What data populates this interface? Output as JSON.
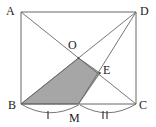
{
  "figure": {
    "kind": "geometry-diagram",
    "shape": "rectangle-with-diagonals",
    "width": 156,
    "height": 127,
    "background_color": "#ffffff",
    "stroke_color": "#555555",
    "label_color": "#1a1a1a",
    "shaded_fill_color": "#a6a6a6",
    "shaded_fill_opacity": 1
  },
  "labels": {
    "A": "A",
    "B": "B",
    "C": "C",
    "D": "D",
    "O": "O",
    "E": "E",
    "M": "M"
  },
  "points": {
    "A": {
      "x": 21,
      "y": 12
    },
    "D": {
      "x": 136,
      "y": 12
    },
    "B": {
      "x": 21,
      "y": 104
    },
    "C": {
      "x": 136,
      "y": 104
    },
    "O": {
      "x": 78.5,
      "y": 58
    },
    "E": {
      "x": 100,
      "y": 73
    },
    "M": {
      "x": 78.5,
      "y": 104
    }
  },
  "segments": [
    {
      "name": "side-AD",
      "from": "A",
      "to": "D"
    },
    {
      "name": "side-AB",
      "from": "A",
      "to": "B"
    },
    {
      "name": "side-DC",
      "from": "D",
      "to": "C"
    },
    {
      "name": "side-BC",
      "from": "B",
      "to": "C"
    },
    {
      "name": "diagonal-AC",
      "from": "A",
      "to": "C"
    },
    {
      "name": "diagonal-BD",
      "from": "B",
      "to": "D"
    },
    {
      "name": "cevian-DM",
      "from": "D",
      "to": "M"
    }
  ],
  "shaded_region": {
    "name": "quadrilateral-BOEM",
    "vertices": [
      "B",
      "O",
      "E",
      "M"
    ]
  },
  "arcs": [
    {
      "name": "arc-BM",
      "from": "B",
      "to": "M",
      "tick_count": 1
    },
    {
      "name": "arc-MC",
      "from": "M",
      "to": "C",
      "tick_count": 2
    }
  ],
  "tick_marks": {
    "single_label": "|",
    "double_label": "||"
  }
}
